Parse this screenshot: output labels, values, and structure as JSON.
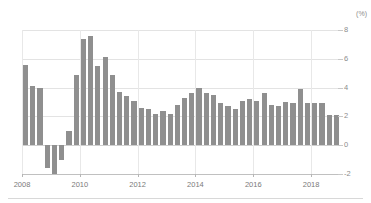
{
  "chart_data": {
    "type": "bar",
    "title": "",
    "subtitle": "",
    "xlabel": "",
    "ylabel": "",
    "unit_label": "(%)",
    "ylim": [
      -2,
      8
    ],
    "yticks": [
      8,
      6,
      4,
      2,
      0,
      -2
    ],
    "ytick_labels": [
      "8",
      "6",
      "4",
      "2",
      "0",
      "-2"
    ],
    "xlim": [
      "2008 Q1",
      "2018 Q4"
    ],
    "xticks": [
      2008,
      2010,
      2012,
      2014,
      2016,
      2018
    ],
    "xtick_labels": [
      "2008",
      "2010",
      "2012",
      "2014",
      "2016",
      "2018"
    ],
    "grid": "horizontal-and-vertical",
    "legend": "none",
    "bar_color": "#8f8f8f",
    "categories": [
      "2008 Q1",
      "2008 Q2",
      "2008 Q3",
      "2008 Q4",
      "2009 Q1",
      "2009 Q2",
      "2009 Q3",
      "2009 Q4",
      "2010 Q1",
      "2010 Q2",
      "2010 Q3",
      "2010 Q4",
      "2011 Q1",
      "2011 Q2",
      "2011 Q3",
      "2011 Q4",
      "2012 Q1",
      "2012 Q2",
      "2012 Q3",
      "2012 Q4",
      "2013 Q1",
      "2013 Q2",
      "2013 Q3",
      "2013 Q4",
      "2014 Q1",
      "2014 Q2",
      "2014 Q3",
      "2014 Q4",
      "2015 Q1",
      "2015 Q2",
      "2015 Q3",
      "2015 Q4",
      "2016 Q1",
      "2016 Q2",
      "2016 Q3",
      "2016 Q4",
      "2017 Q1",
      "2017 Q2",
      "2017 Q3",
      "2017 Q4",
      "2018 Q1",
      "2018 Q2",
      "2018 Q3",
      "2018 Q4"
    ],
    "values": [
      5.6,
      4.1,
      4.0,
      -1.6,
      -2.0,
      -1.0,
      1.0,
      4.9,
      7.4,
      7.6,
      5.5,
      6.1,
      4.9,
      3.7,
      3.4,
      3.1,
      2.6,
      2.5,
      2.2,
      2.4,
      2.2,
      2.8,
      3.3,
      3.6,
      4.0,
      3.6,
      3.5,
      2.9,
      2.7,
      2.5,
      3.1,
      3.2,
      3.1,
      3.6,
      2.8,
      2.7,
      3.0,
      2.9,
      3.9,
      2.9,
      2.9,
      2.9,
      2.1,
      2.1
    ]
  }
}
